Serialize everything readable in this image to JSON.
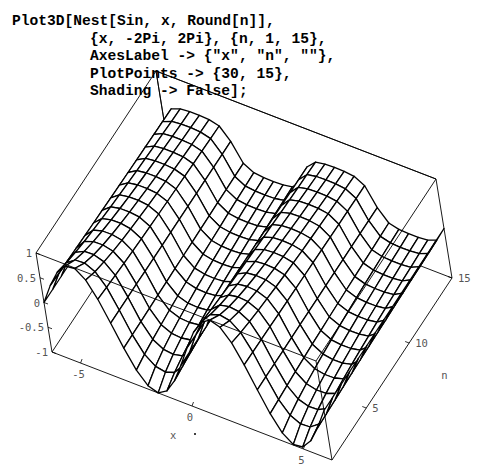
{
  "input_cell": {
    "lines": [
      "Plot3D[Nest[Sin, x, Round[n]],",
      "{x, -2Pi, 2Pi}, {n, 1, 15},",
      "AxesLabel -> {\"x\", \"n\", \"\"},",
      "PlotPoints -> {30, 15},",
      "Shading -> False];"
    ]
  },
  "chart_data": {
    "type": "surface3d",
    "title": "",
    "function": "Nest[Sin, x, Round[n]]",
    "x_range": [
      -6.2832,
      6.2832
    ],
    "n_range": [
      1,
      15
    ],
    "z_range": [
      -1,
      1
    ],
    "plot_points": [
      30,
      15
    ],
    "shading": false,
    "axes_labels": {
      "x": "x",
      "n": "n",
      "z": ""
    },
    "x_ticks": [
      {
        "value": -5,
        "label": "-5"
      },
      {
        "value": 0,
        "label": "0"
      },
      {
        "value": 5,
        "label": "5"
      }
    ],
    "n_ticks": [
      {
        "value": 5,
        "label": "5"
      },
      {
        "value": 10,
        "label": "10"
      },
      {
        "value": 15,
        "label": "15"
      }
    ],
    "z_ticks": [
      {
        "value": 1,
        "label": "1"
      },
      {
        "value": 0.5,
        "label": "0.5"
      },
      {
        "value": 0,
        "label": "0"
      },
      {
        "value": -0.5,
        "label": "-0.5"
      },
      {
        "value": -1,
        "label": "-1"
      }
    ],
    "box": true,
    "grid": false,
    "mesh_color": "#000000",
    "box_color": "#000000"
  }
}
